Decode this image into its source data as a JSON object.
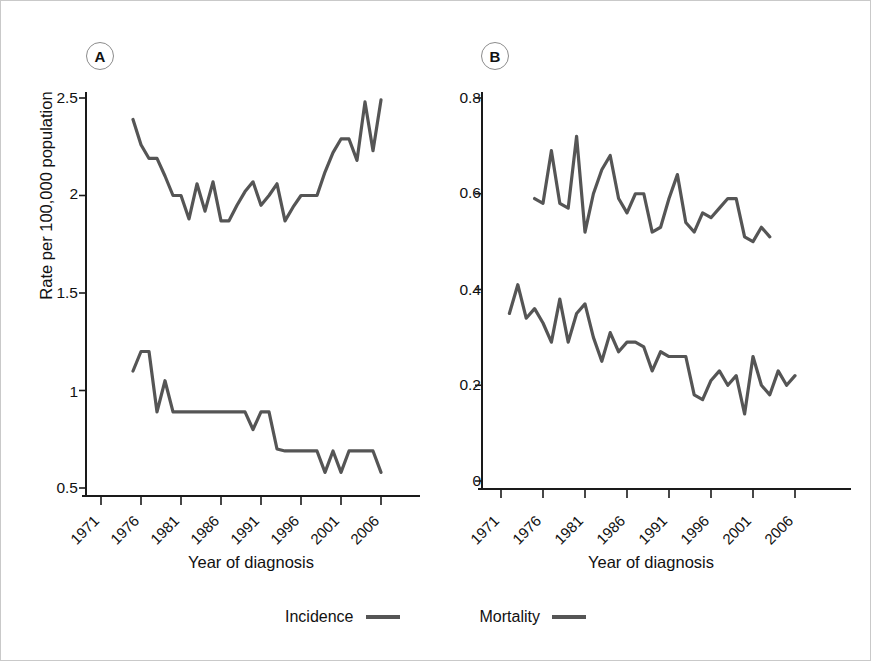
{
  "figure": {
    "background": "#ffffff",
    "line_color": "#555555",
    "axis_color": "#1a1a1a"
  },
  "legend": {
    "position": "bottom-center",
    "items": [
      {
        "label": "Incidence",
        "swatch": "line-swatch",
        "color": "#555555"
      },
      {
        "label": "Mortality",
        "swatch": "line-swatch",
        "color": "#555555"
      }
    ]
  },
  "panels": {
    "a": {
      "badge": "A",
      "ylabel": "Rate per 100,000 population",
      "xlabel": "Year of diagnosis",
      "yticks": [
        "0.5",
        "1",
        "1.5",
        "2",
        "2.5"
      ],
      "xticks": [
        "1971",
        "1976",
        "1981",
        "1986",
        "1991",
        "1996",
        "2001",
        "2006"
      ]
    },
    "b": {
      "badge": "B",
      "ylabel": "",
      "xlabel": "Year of diagnosis",
      "yticks": [
        "0",
        "0.2",
        "0.4",
        "0.6",
        "0.8"
      ],
      "xticks": [
        "1971",
        "1976",
        "1981",
        "1986",
        "1991",
        "1996",
        "2001",
        "2006"
      ]
    }
  },
  "chart_data": [
    {
      "id": "panel-a",
      "type": "line",
      "title": "A",
      "xlabel": "Year of diagnosis",
      "ylabel": "Rate per 100,000 population",
      "xlim": [
        1971,
        2007
      ],
      "ylim": [
        0.5,
        2.55
      ],
      "ytick_values": [
        0.5,
        1.0,
        1.5,
        2.0,
        2.5
      ],
      "xtick_values": [
        1971,
        1976,
        1981,
        1986,
        1991,
        1996,
        2001,
        2006
      ],
      "grid": false,
      "legend": [
        "Incidence",
        "Mortality"
      ],
      "series": [
        {
          "name": "Incidence",
          "color": "#555555",
          "x": [
            1975,
            1976,
            1977,
            1978,
            1979,
            1980,
            1981,
            1982,
            1983,
            1984,
            1985,
            1986,
            1987,
            1988,
            1989,
            1990,
            1991,
            1992,
            1993,
            1994,
            1995,
            1996,
            1997,
            1998,
            1999,
            2000,
            2001,
            2002,
            2003,
            2004,
            2005,
            2006
          ],
          "values": [
            2.39,
            2.26,
            2.19,
            2.19,
            2.1,
            2.0,
            2.0,
            1.88,
            2.06,
            1.92,
            2.07,
            1.87,
            1.87,
            1.95,
            2.02,
            2.07,
            1.95,
            2.0,
            2.06,
            1.87,
            1.94,
            2.0,
            2.0,
            2.0,
            2.12,
            2.22,
            2.29,
            2.29,
            2.18,
            2.48,
            2.23,
            2.49
          ]
        },
        {
          "name": "Mortality",
          "color": "#555555",
          "x": [
            1975,
            1976,
            1977,
            1978,
            1979,
            1980,
            1981,
            1982,
            1983,
            1984,
            1985,
            1986,
            1987,
            1988,
            1989,
            1990,
            1991,
            1992,
            1993,
            1994,
            1995,
            1996,
            1997,
            1998,
            1999,
            2000,
            2001,
            2002,
            2003,
            2004,
            2005,
            2006
          ],
          "values": [
            1.1,
            1.2,
            1.2,
            0.89,
            1.05,
            0.89,
            0.89,
            0.89,
            0.89,
            0.89,
            0.89,
            0.89,
            0.89,
            0.89,
            0.89,
            0.8,
            0.89,
            0.89,
            0.7,
            0.69,
            0.69,
            0.69,
            0.69,
            0.69,
            0.58,
            0.69,
            0.58,
            0.69,
            0.69,
            0.69,
            0.69,
            0.58
          ]
        }
      ]
    },
    {
      "id": "panel-b",
      "type": "line",
      "title": "B",
      "xlabel": "Year of diagnosis",
      "ylabel": "",
      "xlim": [
        1971,
        2007
      ],
      "ylim": [
        0,
        0.82
      ],
      "ytick_values": [
        0,
        0.2,
        0.4,
        0.6,
        0.8
      ],
      "xtick_values": [
        1971,
        1976,
        1981,
        1986,
        1991,
        1996,
        2001,
        2006
      ],
      "grid": false,
      "legend": [
        "Incidence",
        "Mortality"
      ],
      "series": [
        {
          "name": "Incidence",
          "color": "#555555",
          "x": [
            1975,
            1976,
            1977,
            1978,
            1979,
            1980,
            1981,
            1982,
            1983,
            1984,
            1985,
            1986,
            1987,
            1988,
            1989,
            1990,
            1991,
            1992,
            1993,
            1994,
            1995,
            1996,
            1997,
            1998,
            1999,
            2000,
            2001,
            2002,
            2003
          ],
          "values": [
            0.59,
            0.58,
            0.69,
            0.58,
            0.57,
            0.72,
            0.52,
            0.6,
            0.65,
            0.68,
            0.59,
            0.56,
            0.6,
            0.6,
            0.52,
            0.53,
            0.59,
            0.64,
            0.54,
            0.52,
            0.56,
            0.55,
            0.57,
            0.59,
            0.59,
            0.51,
            0.5,
            0.53,
            0.51
          ]
        },
        {
          "name": "Mortality",
          "color": "#555555",
          "x": [
            1972,
            1973,
            1974,
            1975,
            1976,
            1977,
            1978,
            1979,
            1980,
            1981,
            1982,
            1983,
            1984,
            1985,
            1986,
            1987,
            1988,
            1989,
            1990,
            1991,
            1992,
            1993,
            1994,
            1995,
            1996,
            1997,
            1998,
            1999,
            2000,
            2001,
            2002,
            2003,
            2004,
            2005,
            2006
          ],
          "values": [
            0.35,
            0.41,
            0.34,
            0.36,
            0.33,
            0.29,
            0.38,
            0.29,
            0.35,
            0.37,
            0.3,
            0.25,
            0.31,
            0.27,
            0.29,
            0.29,
            0.28,
            0.23,
            0.27,
            0.26,
            0.26,
            0.26,
            0.18,
            0.17,
            0.21,
            0.23,
            0.2,
            0.22,
            0.14,
            0.26,
            0.2,
            0.18,
            0.23,
            0.2,
            0.22
          ]
        }
      ]
    }
  ]
}
